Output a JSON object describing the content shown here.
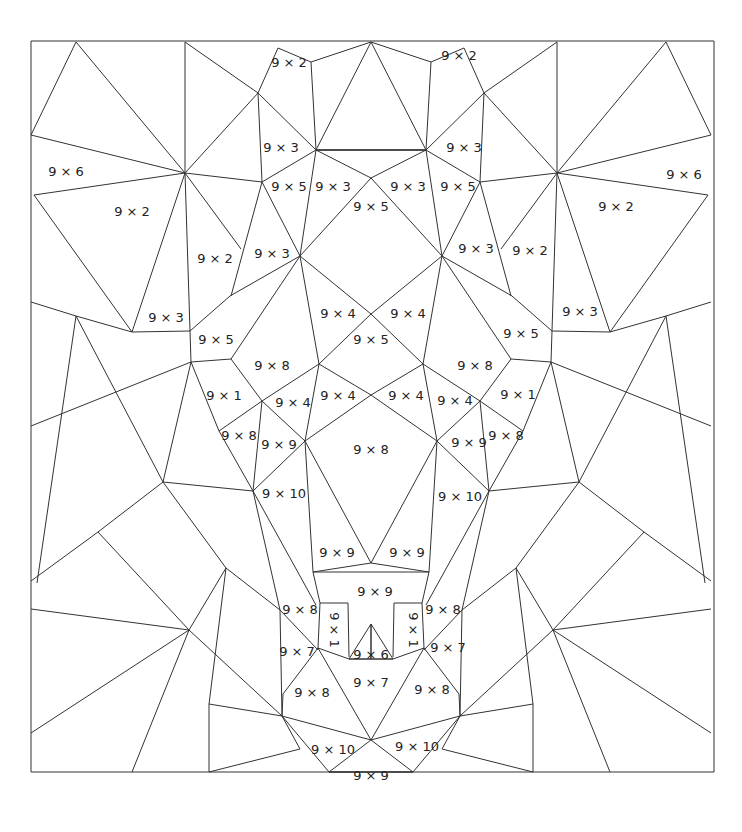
{
  "worksheet": {
    "title": "Color by multiplication (9 times table)",
    "border_color": "#333333",
    "line_color": "#333333",
    "text_color": "#222222",
    "labels": [
      {
        "id": "top-left-a",
        "text": "9 x 2"
      },
      {
        "id": "top-right-a",
        "text": "9 x 2"
      },
      {
        "id": "left-upper-3",
        "text": "9 x 3"
      },
      {
        "id": "right-upper-3",
        "text": "9 x 3"
      },
      {
        "id": "left-6",
        "text": "9 x 6"
      },
      {
        "id": "right-6",
        "text": "9 x 6"
      },
      {
        "id": "left-5a",
        "text": "9 x 5"
      },
      {
        "id": "left-3b",
        "text": "9 x 3"
      },
      {
        "id": "right-3b",
        "text": "9 x 3"
      },
      {
        "id": "right-5a",
        "text": "9 x 5"
      },
      {
        "id": "left-2b",
        "text": "9 x 2"
      },
      {
        "id": "right-2b",
        "text": "9 x 2"
      },
      {
        "id": "center-5a",
        "text": "9 x 5"
      },
      {
        "id": "left-2c",
        "text": "9 x 2"
      },
      {
        "id": "left-3c",
        "text": "9 x 3"
      },
      {
        "id": "right-3c",
        "text": "9 x 3"
      },
      {
        "id": "right-2c",
        "text": "9 x 2"
      },
      {
        "id": "left-3d",
        "text": "9 x 3"
      },
      {
        "id": "right-3d",
        "text": "9 x 3"
      },
      {
        "id": "left-4a",
        "text": "9 x 4"
      },
      {
        "id": "right-4a",
        "text": "9 x 4"
      },
      {
        "id": "left-5b",
        "text": "9 x 5"
      },
      {
        "id": "center-5b",
        "text": "9 x 5"
      },
      {
        "id": "right-5b",
        "text": "9 x 5"
      },
      {
        "id": "left-8a",
        "text": "9 x 8"
      },
      {
        "id": "right-8a",
        "text": "9 x 8"
      },
      {
        "id": "left-1",
        "text": "9 x 1"
      },
      {
        "id": "right-1",
        "text": "9 x 1"
      },
      {
        "id": "left-4b",
        "text": "9 x 4"
      },
      {
        "id": "left-4c",
        "text": "9 x 4"
      },
      {
        "id": "right-4c",
        "text": "9 x 4"
      },
      {
        "id": "right-4b",
        "text": "9 x 4"
      },
      {
        "id": "left-8b",
        "text": "9 x 8"
      },
      {
        "id": "left-9a",
        "text": "9 x 9"
      },
      {
        "id": "center-8",
        "text": "9 x 8"
      },
      {
        "id": "right-9a",
        "text": "9 x 9"
      },
      {
        "id": "right-8b",
        "text": "9 x 8"
      },
      {
        "id": "left-10a",
        "text": "9 x 10"
      },
      {
        "id": "right-10a",
        "text": "9 x 10"
      },
      {
        "id": "left-9b",
        "text": "9 x 9"
      },
      {
        "id": "right-9b",
        "text": "9 x 9"
      },
      {
        "id": "mouth-9",
        "text": "9 x 9"
      },
      {
        "id": "left-8c",
        "text": "9 x 8"
      },
      {
        "id": "right-8c",
        "text": "9 x 8"
      },
      {
        "id": "left-fang-1",
        "text": "9 x 1"
      },
      {
        "id": "right-fang-1",
        "text": "9 x 1"
      },
      {
        "id": "left-7a",
        "text": "9 x 7"
      },
      {
        "id": "center-6",
        "text": "9 x 6"
      },
      {
        "id": "right-7a",
        "text": "9 x 7"
      },
      {
        "id": "center-7",
        "text": "9 x 7"
      },
      {
        "id": "left-8d",
        "text": "9 x 8"
      },
      {
        "id": "right-8d",
        "text": "9 x 8"
      },
      {
        "id": "left-10b",
        "text": "9 x 10"
      },
      {
        "id": "right-10b",
        "text": "9 x 10"
      },
      {
        "id": "bottom-9",
        "text": "9 x 9"
      }
    ]
  }
}
